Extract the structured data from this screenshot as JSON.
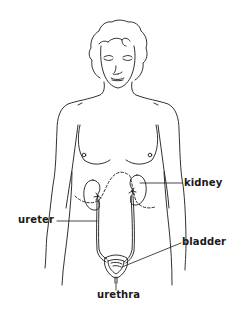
{
  "diagram": {
    "line_color": "#1a1a1a",
    "background": "#ffffff",
    "labels": {
      "kidney": "kidney",
      "ureter": "ureter",
      "bladder": "bladder",
      "urethra": "urethra"
    }
  }
}
